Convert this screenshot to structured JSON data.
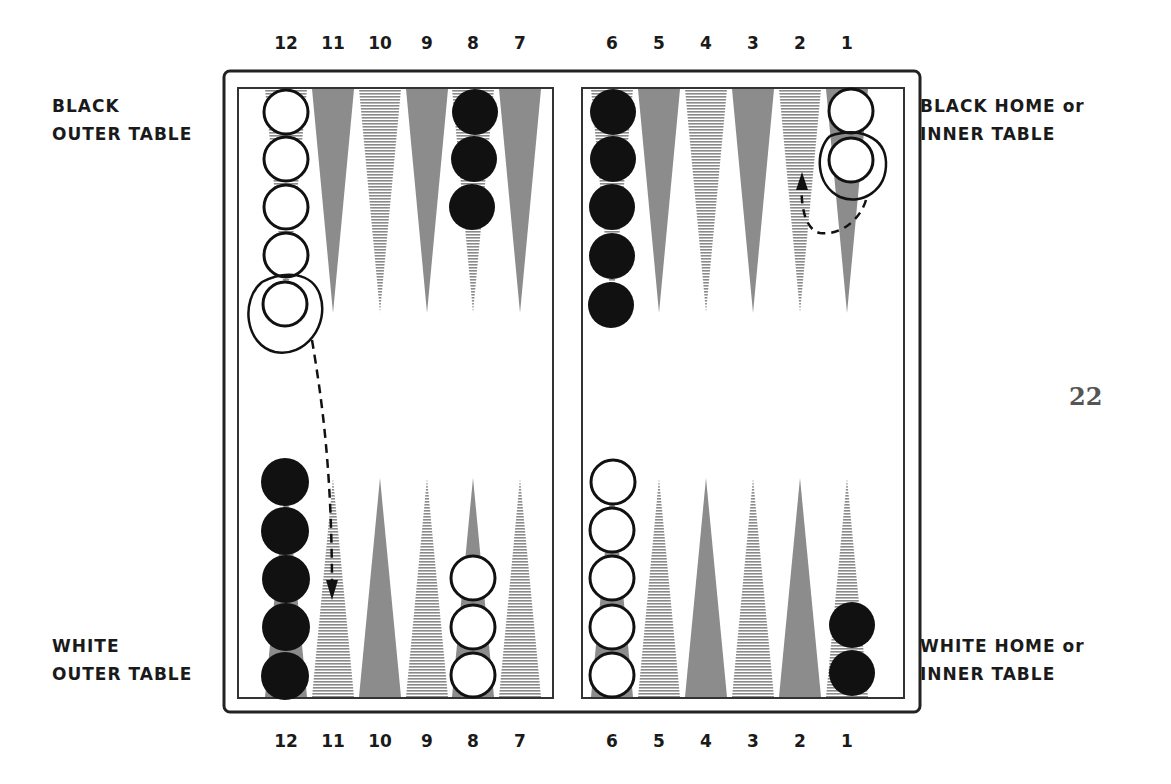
{
  "labels": {
    "top_left": [
      "BLACK",
      "OUTER TABLE"
    ],
    "top_right": [
      "BLACK HOME or",
      "INNER TABLE"
    ],
    "bottom_left": [
      "WHITE",
      "OUTER TABLE"
    ],
    "bottom_right": [
      "WHITE HOME or",
      "INNER TABLE"
    ]
  },
  "page_number": "22",
  "point_numbers_top": [
    "12",
    "11",
    "10",
    "9",
    "8",
    "7",
    "6",
    "5",
    "4",
    "3",
    "2",
    "1"
  ],
  "point_numbers_bottom": [
    "12",
    "11",
    "10",
    "9",
    "8",
    "7",
    "6",
    "5",
    "4",
    "3",
    "2",
    "1"
  ],
  "colors": {
    "frame": "#222222",
    "point_solid": "#8c8c8c",
    "point_hatched": "#9a9a9a",
    "black_checker": "#111111",
    "white_checker": "#ffffff"
  },
  "position": {
    "top": [
      {
        "point": "12",
        "white": 5
      },
      {
        "point": "11"
      },
      {
        "point": "10"
      },
      {
        "point": "9"
      },
      {
        "point": "8",
        "black": 3
      },
      {
        "point": "7"
      },
      {
        "point": "6",
        "black": 5
      },
      {
        "point": "5"
      },
      {
        "point": "4"
      },
      {
        "point": "3"
      },
      {
        "point": "2"
      },
      {
        "point": "1",
        "white": 2
      }
    ],
    "bottom": [
      {
        "point": "12",
        "black": 5
      },
      {
        "point": "11"
      },
      {
        "point": "10"
      },
      {
        "point": "9"
      },
      {
        "point": "8",
        "white": 3
      },
      {
        "point": "7"
      },
      {
        "point": "6",
        "white": 5
      },
      {
        "point": "5"
      },
      {
        "point": "4"
      },
      {
        "point": "3"
      },
      {
        "point": "2"
      },
      {
        "point": "1",
        "black": 2
      }
    ]
  },
  "annotations": [
    {
      "type": "circled-checker",
      "location": "top point 12, 5th white checker"
    },
    {
      "type": "dashed-arrow",
      "from": "top point 12",
      "to": "bottom point 11"
    },
    {
      "type": "circled-checker",
      "location": "top point 1, 2nd white checker"
    },
    {
      "type": "dashed-arrow",
      "from": "top point 1",
      "to": "top point 2"
    }
  ]
}
